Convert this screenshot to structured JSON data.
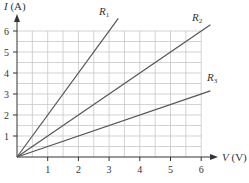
{
  "chart_data": {
    "type": "line",
    "title": "",
    "xlabel": "V (V)",
    "ylabel": "I (A)",
    "xlim": [
      0,
      6
    ],
    "ylim": [
      0,
      6
    ],
    "x_ticks": [
      1,
      2,
      3,
      4,
      5,
      6
    ],
    "y_ticks": [
      1,
      2,
      3,
      4,
      5,
      6
    ],
    "grid": true,
    "grid_step": 0.5,
    "legend_position": "inline labels at line ends",
    "series": [
      {
        "name": "R1",
        "x": [
          0,
          3.3
        ],
        "y": [
          0,
          6.6
        ],
        "slope": 2.0
      },
      {
        "name": "R2",
        "x": [
          0,
          6.3
        ],
        "y": [
          0,
          6.3
        ],
        "slope": 1.0
      },
      {
        "name": "R3",
        "x": [
          0,
          6.3
        ],
        "y": [
          0,
          3.15
        ],
        "slope": 0.5
      }
    ]
  },
  "axes": {
    "x_title_var": "V",
    "x_title_unit": " (V)",
    "y_title_var": "I",
    "y_title_unit": " (A)",
    "x_tick_labels": [
      "1",
      "2",
      "3",
      "4",
      "5",
      "6"
    ],
    "y_tick_labels": [
      "1",
      "2",
      "3",
      "4",
      "5",
      "6"
    ]
  },
  "labels": {
    "r1": {
      "letter": "R",
      "sub": "1"
    },
    "r2": {
      "letter": "R",
      "sub": "2"
    },
    "r3": {
      "letter": "R",
      "sub": "3"
    }
  },
  "colors": {
    "grid": "#c8c8c8",
    "axis": "#333333",
    "line": "#555555",
    "text": "#333333"
  }
}
